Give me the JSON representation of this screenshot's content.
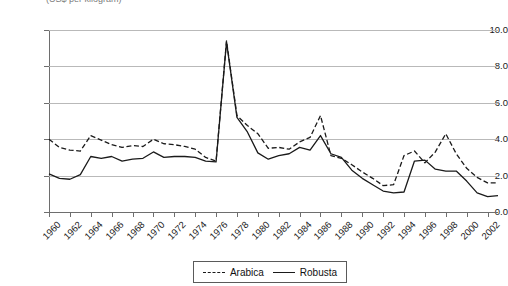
{
  "chart_data": {
    "type": "line",
    "title": "(US$ per kilogram)",
    "xlabel": "",
    "ylabel": "",
    "ylim": [
      0.0,
      10.0
    ],
    "ytick_labels": [
      "0.0",
      "2.0",
      "4.0",
      "6.0",
      "8.0",
      "10.0"
    ],
    "ytick_values": [
      0.0,
      2.0,
      4.0,
      6.0,
      8.0,
      10.0
    ],
    "grid": true,
    "legend_position": "bottom",
    "x": [
      1960,
      1961,
      1962,
      1963,
      1964,
      1965,
      1966,
      1967,
      1968,
      1969,
      1970,
      1971,
      1972,
      1973,
      1974,
      1975,
      1976,
      1977,
      1978,
      1979,
      1980,
      1981,
      1982,
      1983,
      1984,
      1985,
      1986,
      1987,
      1988,
      1989,
      1990,
      1991,
      1992,
      1993,
      1994,
      1995,
      1996,
      1997,
      1998,
      1999,
      2000,
      2001,
      2002,
      2003
    ],
    "xtick_labels": [
      "1960",
      "1962",
      "1964",
      "1966",
      "1968",
      "1970",
      "1972",
      "1974",
      "1976",
      "1978",
      "1980",
      "1982",
      "1984",
      "1986",
      "1988",
      "1990",
      "1992",
      "1994",
      "1996",
      "1998",
      "2000",
      "2002"
    ],
    "series": [
      {
        "name": "Arabica",
        "style": "dashed",
        "color": "#1a1a1a",
        "values": [
          4.0,
          3.55,
          3.4,
          3.35,
          4.2,
          3.95,
          3.7,
          3.55,
          3.65,
          3.6,
          4.0,
          3.75,
          3.7,
          3.6,
          3.45,
          3.0,
          2.8,
          9.4,
          5.3,
          4.75,
          4.3,
          3.5,
          3.55,
          3.45,
          3.85,
          4.1,
          5.3,
          3.1,
          2.95,
          2.6,
          2.2,
          1.85,
          1.45,
          1.5,
          3.1,
          3.35,
          2.7,
          3.3,
          4.3,
          3.2,
          2.4,
          1.9,
          1.6,
          1.6
        ]
      },
      {
        "name": "Robusta",
        "style": "solid",
        "color": "#1a1a1a",
        "values": [
          2.1,
          1.85,
          1.8,
          2.05,
          3.05,
          2.95,
          3.05,
          2.8,
          2.9,
          2.95,
          3.3,
          3.0,
          3.05,
          3.05,
          3.0,
          2.8,
          2.75,
          9.35,
          5.2,
          4.4,
          3.25,
          2.9,
          3.1,
          3.2,
          3.55,
          3.4,
          4.2,
          3.2,
          3.0,
          2.3,
          1.85,
          1.5,
          1.15,
          1.05,
          1.1,
          2.8,
          2.85,
          2.35,
          2.25,
          2.25,
          1.7,
          1.05,
          0.85,
          0.9
        ]
      }
    ]
  },
  "legend": {
    "items": [
      {
        "label": "Arabica"
      },
      {
        "label": "Robusta"
      }
    ]
  }
}
